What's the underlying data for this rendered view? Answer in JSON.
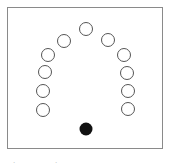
{
  "diagram": {
    "open_circles": [
      {
        "cx": 86,
        "cy": 29
      },
      {
        "cx": 64,
        "cy": 41
      },
      {
        "cx": 48,
        "cy": 55
      },
      {
        "cx": 45,
        "cy": 72
      },
      {
        "cx": 43,
        "cy": 91
      },
      {
        "cx": 43,
        "cy": 110
      },
      {
        "cx": 108,
        "cy": 40
      },
      {
        "cx": 124,
        "cy": 55
      },
      {
        "cx": 127,
        "cy": 73
      },
      {
        "cx": 128,
        "cy": 91
      },
      {
        "cx": 128,
        "cy": 109
      }
    ],
    "filled_circle": {
      "cx": 86,
      "cy": 129
    },
    "radius": 6.5,
    "stroke_color": "#555555",
    "fill_color": "#111111"
  },
  "captions": [
    ".",
    "."
  ]
}
